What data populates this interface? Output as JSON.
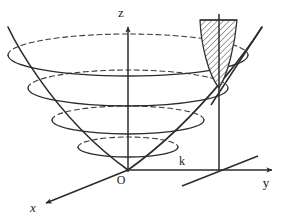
{
  "figure": {
    "background_color": "#ffffff",
    "stroke_color": "#2b2b2b",
    "hatch_color": "#4a4a4a",
    "hatch_fill": "#e8e8e8",
    "width": 288,
    "height": 218
  },
  "axes": [
    {
      "name": "z-axis",
      "label": "z",
      "label_x": 121,
      "label_y": 17,
      "italic": false
    },
    {
      "name": "y-axis",
      "label": "y",
      "label_x": 266,
      "label_y": 187,
      "italic": false
    },
    {
      "name": "x-axis",
      "label": "x",
      "label_x": 33,
      "label_y": 212,
      "italic": true
    }
  ],
  "points": [
    {
      "name": "origin",
      "label": "O",
      "label_x": 121,
      "label_y": 184
    },
    {
      "name": "k-mark",
      "label": "k",
      "label_x": 182,
      "label_y": 165
    }
  ],
  "geometry": {
    "origin": {
      "x": 128,
      "y": 170
    },
    "z_axis_top": {
      "x": 128,
      "y": 25
    },
    "y_axis_end": {
      "x": 276,
      "y": 170
    },
    "x_axis_end": {
      "x": 42,
      "y": 205
    },
    "k_point": {
      "x": 219,
      "y": 170
    },
    "surface_point": {
      "x": 219,
      "y": 88
    },
    "paraboloid_left_rim": {
      "x": 8,
      "y": 27
    },
    "paraboloid_right_rim": {
      "x": 262,
      "y": 27
    },
    "paraboloid_bottom": {
      "x": 128,
      "y": 170
    },
    "ellipse_count": 4,
    "ellipses": [
      {
        "cy": 55,
        "rx": 120,
        "ry": 21
      },
      {
        "cy": 88,
        "rx": 100,
        "ry": 18
      },
      {
        "cy": 120,
        "rx": 76,
        "ry": 14
      },
      {
        "cy": 147,
        "rx": 50,
        "ry": 10
      }
    ],
    "hatched_region": {
      "name": "shaded-cross-section",
      "vertex": {
        "x": 219,
        "y": 88
      },
      "top_left": {
        "x": 200,
        "y": 20
      },
      "top_right": {
        "x": 237,
        "y": 20
      },
      "hatch_angle_deg": 45,
      "hatch_spacing": 4
    }
  }
}
